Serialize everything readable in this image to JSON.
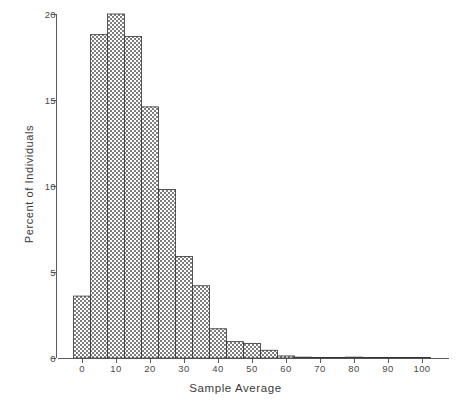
{
  "chart_data": {
    "type": "bar",
    "title": "",
    "subtitle": "",
    "xlabel": "Sample Average",
    "ylabel": "Percent of Individuals",
    "xlim": [
      -7,
      108
    ],
    "ylim": [
      0,
      20
    ],
    "grid": false,
    "legend": null,
    "bin_width": 5,
    "bar_style": "cross-hatched",
    "xticks": [
      0,
      10,
      20,
      30,
      40,
      50,
      60,
      70,
      80,
      90,
      100
    ],
    "xtick_labels": [
      "0",
      "10",
      "20",
      "30",
      "40",
      "50",
      "60",
      "70",
      "80",
      "90",
      "100"
    ],
    "yticks": [
      0,
      5,
      10,
      15,
      20
    ],
    "ytick_labels": [
      "0",
      "5",
      "10",
      "15",
      "20"
    ],
    "bin_starts": [
      -2.5,
      2.5,
      7.5,
      12.5,
      17.5,
      22.5,
      27.5,
      32.5,
      37.5,
      42.5,
      47.5,
      52.5,
      57.5,
      62.5,
      67.5,
      72.5,
      77.5,
      82.5,
      87.5,
      92.5,
      97.5
    ],
    "bin_centers": [
      0,
      5,
      10,
      15,
      20,
      25,
      30,
      35,
      40,
      45,
      50,
      55,
      60,
      65,
      70,
      75,
      80,
      85,
      90,
      95,
      100
    ],
    "categories": [
      "0",
      "5",
      "10",
      "15",
      "20",
      "25",
      "30",
      "35",
      "40",
      "45",
      "50",
      "55",
      "60",
      "65",
      "70",
      "75",
      "80",
      "85",
      "90",
      "95",
      "100"
    ],
    "values": [
      3.6,
      18.8,
      20.0,
      18.7,
      14.6,
      9.8,
      5.9,
      4.2,
      1.7,
      0.95,
      0.85,
      0.45,
      0.12,
      0.05,
      0.03,
      0.03,
      0.05,
      0.03,
      0.02,
      0.02,
      0.02
    ]
  },
  "axes": {
    "x_label": "Sample Average",
    "y_label": "Percent of Individuals"
  }
}
